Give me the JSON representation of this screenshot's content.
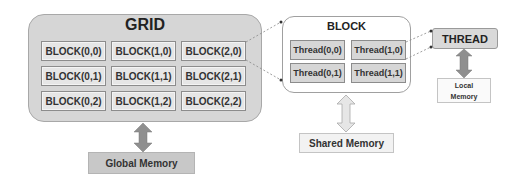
{
  "grid": {
    "title": "GRID",
    "blocks": [
      [
        "BLOCK(0,0)",
        "BLOCK(1,0)",
        "BLOCK(2,0)"
      ],
      [
        "BLOCK(0,1)",
        "BLOCK(1,1)",
        "BLOCK(2,1)"
      ],
      [
        "BLOCK(0,2)",
        "BLOCK(1,2)",
        "BLOCK(2,2)"
      ]
    ],
    "memory_label": "Global Memory"
  },
  "block": {
    "title": "BLOCK",
    "threads": [
      [
        "Thread(0,0)",
        "Thread(1,0)"
      ],
      [
        "Thread(0,1)",
        "Thread(1,1)"
      ]
    ],
    "memory_label": "Shared Memory"
  },
  "thread": {
    "title": "THREAD",
    "memory_label_line1": "Local",
    "memory_label_line2": "Memory"
  },
  "colors": {
    "grid_fill": "#d6d6d6",
    "cell_fill": "#e6e6e6",
    "global_memory_fill": "#c8c8c8",
    "arrow_gray": "#8f8f8f",
    "arrow_light": "#e0e0e0"
  }
}
